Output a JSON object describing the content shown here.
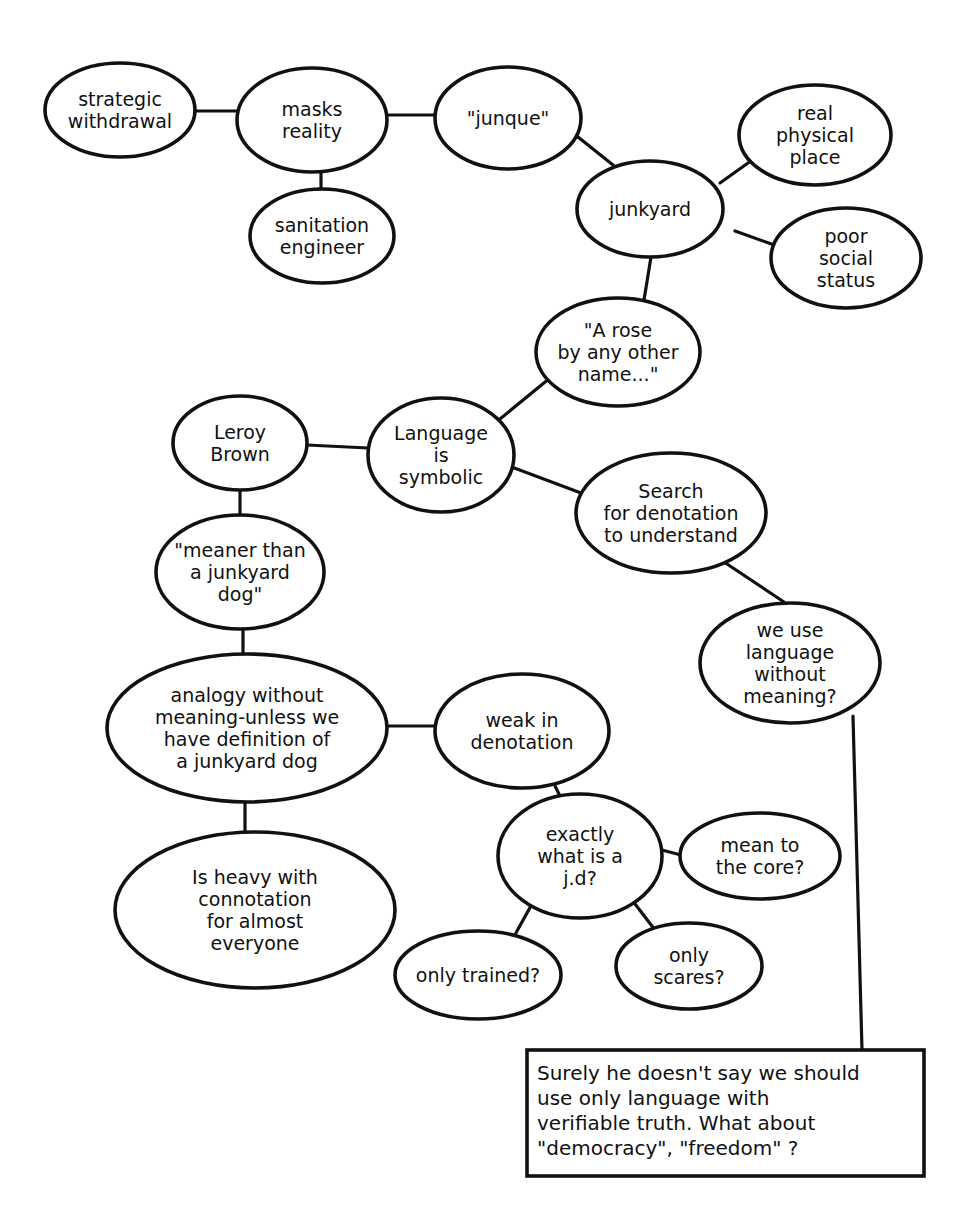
{
  "diagram": {
    "type": "concept-map",
    "style": {
      "stroke": "#111111",
      "background": "#ffffff"
    },
    "nodes": [
      {
        "id": "strategic-withdrawal",
        "shape": "ellipse",
        "cx": 120,
        "cy": 110,
        "rx": 75,
        "ry": 47,
        "lines": [
          "strategic",
          "withdrawal"
        ]
      },
      {
        "id": "masks-reality",
        "shape": "ellipse",
        "cx": 312,
        "cy": 120,
        "rx": 75,
        "ry": 52,
        "lines": [
          "masks",
          "reality"
        ]
      },
      {
        "id": "junque",
        "shape": "ellipse",
        "cx": 508,
        "cy": 118,
        "rx": 73,
        "ry": 51,
        "lines": [
          "\"junque\""
        ]
      },
      {
        "id": "sanitation-engineer",
        "shape": "ellipse",
        "cx": 322,
        "cy": 236,
        "rx": 72,
        "ry": 47,
        "lines": [
          "sanitation",
          "engineer"
        ]
      },
      {
        "id": "junkyard",
        "shape": "ellipse",
        "cx": 650,
        "cy": 209,
        "rx": 73,
        "ry": 48,
        "lines": [
          "junkyard"
        ]
      },
      {
        "id": "real-physical-place",
        "shape": "ellipse",
        "cx": 815,
        "cy": 135,
        "rx": 76,
        "ry": 50,
        "lines": [
          "real",
          "physical",
          "place"
        ]
      },
      {
        "id": "poor-social-status",
        "shape": "ellipse",
        "cx": 846,
        "cy": 258,
        "rx": 75,
        "ry": 50,
        "lines": [
          "poor",
          "social",
          "status"
        ]
      },
      {
        "id": "a-rose",
        "shape": "ellipse",
        "cx": 618,
        "cy": 352,
        "rx": 82,
        "ry": 54,
        "lines": [
          "\"A rose",
          "by any other",
          "name...\""
        ]
      },
      {
        "id": "leroy-brown",
        "shape": "ellipse",
        "cx": 240,
        "cy": 443,
        "rx": 67,
        "ry": 47,
        "lines": [
          "Leroy",
          "Brown"
        ]
      },
      {
        "id": "language-symbolic",
        "shape": "ellipse",
        "cx": 441,
        "cy": 455,
        "rx": 73,
        "ry": 57,
        "lines": [
          "Language",
          "is",
          "symbolic"
        ]
      },
      {
        "id": "search-denotation",
        "shape": "ellipse",
        "cx": 671,
        "cy": 513,
        "rx": 95,
        "ry": 60,
        "lines": [
          "Search",
          "for denotation",
          "to understand"
        ]
      },
      {
        "id": "meaner-than",
        "shape": "ellipse",
        "cx": 240,
        "cy": 572,
        "rx": 84,
        "ry": 57,
        "lines": [
          "\"meaner than",
          "a junkyard",
          "dog\""
        ]
      },
      {
        "id": "we-use-language",
        "shape": "ellipse",
        "cx": 790,
        "cy": 663,
        "rx": 90,
        "ry": 60,
        "lines": [
          "we use",
          "language",
          "without",
          "meaning?"
        ]
      },
      {
        "id": "analogy-without-meaning",
        "shape": "ellipse",
        "cx": 247,
        "cy": 728,
        "rx": 140,
        "ry": 74,
        "lines": [
          "analogy without",
          "meaning-unless we",
          "have definition of",
          "a junkyard dog"
        ]
      },
      {
        "id": "weak-in-denotation",
        "shape": "ellipse",
        "cx": 522,
        "cy": 731,
        "rx": 87,
        "ry": 57,
        "lines": [
          "weak in",
          "denotation"
        ]
      },
      {
        "id": "heavy-connotation",
        "shape": "ellipse",
        "cx": 255,
        "cy": 910,
        "rx": 140,
        "ry": 78,
        "lines": [
          "Is heavy with",
          "connotation",
          "for almost",
          "everyone"
        ]
      },
      {
        "id": "exactly-what-is-jd",
        "shape": "ellipse",
        "cx": 580,
        "cy": 856,
        "rx": 82,
        "ry": 62,
        "lines": [
          "exactly",
          "what is a",
          "j.d?"
        ]
      },
      {
        "id": "mean-to-core",
        "shape": "ellipse",
        "cx": 760,
        "cy": 856,
        "rx": 80,
        "ry": 43,
        "lines": [
          "mean to",
          "the core?"
        ]
      },
      {
        "id": "only-trained",
        "shape": "ellipse",
        "cx": 478,
        "cy": 975,
        "rx": 83,
        "ry": 44,
        "lines": [
          "only trained?"
        ]
      },
      {
        "id": "only-scares",
        "shape": "ellipse",
        "cx": 689,
        "cy": 966,
        "rx": 73,
        "ry": 43,
        "lines": [
          "only",
          "scares?"
        ]
      },
      {
        "id": "surely-he-doesnt",
        "shape": "box",
        "x": 527,
        "y": 1050,
        "w": 397,
        "h": 126,
        "lines": [
          "Surely he doesn't say we should",
          "use only language with",
          "verifiable truth. What about",
          "\"democracy\", \"freedom\" ?"
        ]
      }
    ],
    "edges": [
      {
        "from": "strategic-withdrawal",
        "to": "masks-reality",
        "points": [
          [
            195,
            111
          ],
          [
            237,
            111
          ]
        ]
      },
      {
        "from": "masks-reality",
        "to": "junque",
        "points": [
          [
            387,
            115
          ],
          [
            435,
            115
          ]
        ]
      },
      {
        "from": "masks-reality",
        "to": "sanitation-engineer",
        "points": [
          [
            321,
            165
          ],
          [
            321,
            193
          ]
        ]
      },
      {
        "from": "junque",
        "to": "junkyard",
        "points": [
          [
            578,
            137
          ],
          [
            628,
            177
          ]
        ]
      },
      {
        "from": "junkyard",
        "to": "real-physical-place",
        "points": [
          [
            720,
            183
          ],
          [
            755,
            158
          ]
        ]
      },
      {
        "from": "junkyard",
        "to": "poor-social-status",
        "points": [
          [
            735,
            231
          ],
          [
            777,
            246
          ]
        ]
      },
      {
        "from": "junkyard",
        "to": "a-rose",
        "points": [
          [
            651,
            257
          ],
          [
            644,
            300
          ]
        ]
      },
      {
        "from": "a-rose",
        "to": "language-symbolic",
        "points": [
          [
            550,
            378
          ],
          [
            500,
            419
          ]
        ]
      },
      {
        "from": "leroy-brown",
        "to": "language-symbolic",
        "points": [
          [
            307,
            445
          ],
          [
            368,
            448
          ]
        ]
      },
      {
        "from": "language-symbolic",
        "to": "search-denotation",
        "points": [
          [
            509,
            466
          ],
          [
            581,
            493
          ]
        ]
      },
      {
        "from": "leroy-brown",
        "to": "meaner-than",
        "points": [
          [
            240,
            490
          ],
          [
            240,
            515
          ]
        ]
      },
      {
        "from": "search-denotation",
        "to": "we-use-language",
        "points": [
          [
            724,
            562
          ],
          [
            784,
            602
          ]
        ]
      },
      {
        "from": "meaner-than",
        "to": "analogy-without-meaning",
        "points": [
          [
            243,
            629
          ],
          [
            243,
            657
          ]
        ]
      },
      {
        "from": "analogy-without-meaning",
        "to": "weak-in-denotation",
        "points": [
          [
            387,
            726
          ],
          [
            437,
            726
          ]
        ]
      },
      {
        "from": "analogy-without-meaning",
        "to": "heavy-connotation",
        "points": [
          [
            245,
            802
          ],
          [
            245,
            832
          ]
        ]
      },
      {
        "from": "weak-in-denotation",
        "to": "exactly-what-is-jd",
        "points": [
          [
            555,
            786
          ],
          [
            562,
            800
          ]
        ]
      },
      {
        "from": "exactly-what-is-jd",
        "to": "mean-to-core",
        "points": [
          [
            658,
            849
          ],
          [
            681,
            855
          ]
        ]
      },
      {
        "from": "exactly-what-is-jd",
        "to": "only-trained",
        "points": [
          [
            532,
            904
          ],
          [
            512,
            940
          ]
        ]
      },
      {
        "from": "exactly-what-is-jd",
        "to": "only-scares",
        "points": [
          [
            632,
            900
          ],
          [
            655,
            930
          ]
        ]
      },
      {
        "from": "we-use-language",
        "to": "surely-he-doesnt",
        "points": [
          [
            853,
            716
          ],
          [
            862,
            1050
          ]
        ]
      }
    ]
  }
}
